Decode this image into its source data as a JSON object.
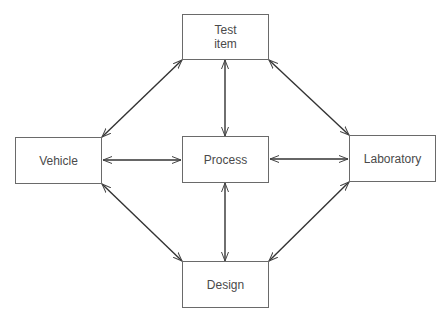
{
  "diagram": {
    "type": "bidirectional-network",
    "nodes": {
      "test_item": {
        "label": "Test\nitem"
      },
      "vehicle": {
        "label": "Vehicle"
      },
      "process": {
        "label": "Process"
      },
      "laboratory": {
        "label": "Laboratory"
      },
      "design": {
        "label": "Design"
      }
    },
    "edges": [
      {
        "from": "Test item",
        "to": "Vehicle",
        "direction": "both"
      },
      {
        "from": "Test item",
        "to": "Process",
        "direction": "both"
      },
      {
        "from": "Test item",
        "to": "Laboratory",
        "direction": "both"
      },
      {
        "from": "Vehicle",
        "to": "Process",
        "direction": "both"
      },
      {
        "from": "Process",
        "to": "Laboratory",
        "direction": "both"
      },
      {
        "from": "Vehicle",
        "to": "Design",
        "direction": "both"
      },
      {
        "from": "Process",
        "to": "Design",
        "direction": "both"
      },
      {
        "from": "Laboratory",
        "to": "Design",
        "direction": "both"
      }
    ],
    "colors": {
      "line": "#333333",
      "box_border": "#6a6a6a",
      "text": "#4a4a4a",
      "background": "#ffffff"
    }
  }
}
